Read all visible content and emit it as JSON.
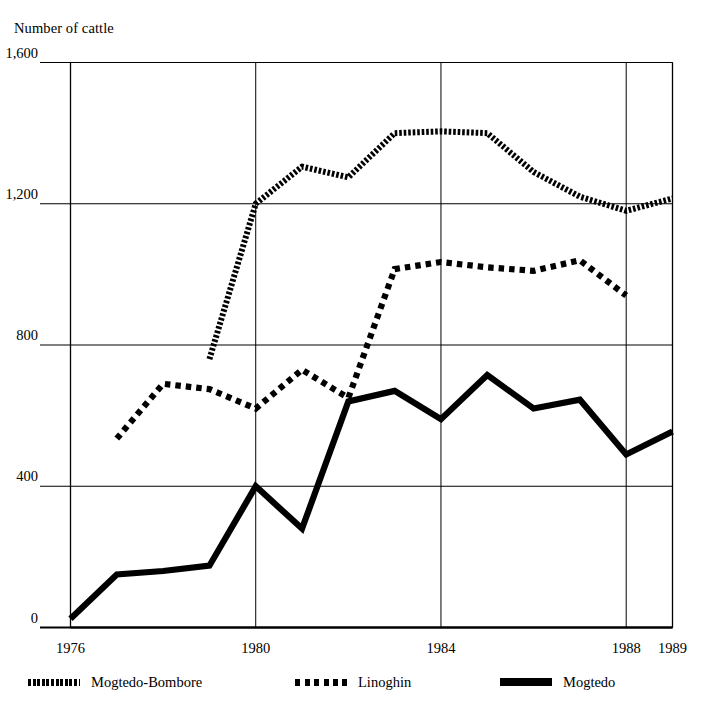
{
  "chart_data": {
    "type": "line",
    "title": "",
    "ylabel": "Number of cattle",
    "xlabel": "",
    "ylim": [
      0,
      1600
    ],
    "xlim": [
      1976,
      1989
    ],
    "yticks": [
      "0",
      "400",
      "800",
      "1,200",
      "1,600"
    ],
    "ytick_values": [
      0,
      400,
      800,
      1200,
      1600
    ],
    "xticks": [
      "1976",
      "1980",
      "1984",
      "1988",
      "1989"
    ],
    "xtick_values": [
      1976,
      1980,
      1984,
      1988,
      1989
    ],
    "grid": true,
    "legend_position": "bottom",
    "x": [
      1976,
      1977,
      1978,
      1979,
      1980,
      1981,
      1982,
      1983,
      1984,
      1985,
      1986,
      1987,
      1988,
      1989
    ],
    "series": [
      {
        "name": "Mogtedo-Bombore",
        "style": "fine-dotted",
        "x": [
          1979,
          1980,
          1981,
          1982,
          1983,
          1984,
          1985,
          1986,
          1987,
          1988,
          1989
        ],
        "values": [
          760,
          1200,
          1305,
          1275,
          1400,
          1405,
          1400,
          1290,
          1220,
          1180,
          1215
        ]
      },
      {
        "name": "Linoghin",
        "style": "coarse-dotted",
        "x": [
          1977,
          1978,
          1979,
          1980,
          1981,
          1982,
          1983,
          1984,
          1985,
          1986,
          1987,
          1988
        ],
        "values": [
          535,
          690,
          675,
          620,
          730,
          650,
          1015,
          1035,
          1020,
          1010,
          1040,
          940
        ]
      },
      {
        "name": "Mogtedo",
        "style": "solid",
        "x": [
          1976,
          1977,
          1978,
          1979,
          1980,
          1981,
          1982,
          1983,
          1984,
          1985,
          1986,
          1987,
          1988,
          1989
        ],
        "values": [
          25,
          150,
          160,
          175,
          400,
          280,
          640,
          670,
          590,
          715,
          620,
          645,
          490,
          555
        ]
      }
    ],
    "colors": {
      "line": "#000000",
      "grid": "#000000",
      "background": "#ffffff"
    }
  },
  "legend": {
    "items": [
      {
        "label": "Mogtedo-Bombore",
        "swatch": "fine-dotted-swatch"
      },
      {
        "label": "Linoghin",
        "swatch": "coarse-dotted-swatch"
      },
      {
        "label": "Mogtedo",
        "swatch": "solid-swatch"
      }
    ]
  }
}
